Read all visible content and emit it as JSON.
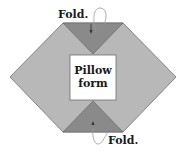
{
  "diagram": {
    "top_label": "Fold.",
    "bottom_label": "Fold.",
    "center_label_line1": "Pillow",
    "center_label_line2": "form",
    "colors": {
      "fabric_light": "#b8b8b8",
      "fabric_dark": "#8a8a8a",
      "outline": "#6e6e6e",
      "center_box": "#ffffff",
      "arrow": "#333333"
    }
  }
}
